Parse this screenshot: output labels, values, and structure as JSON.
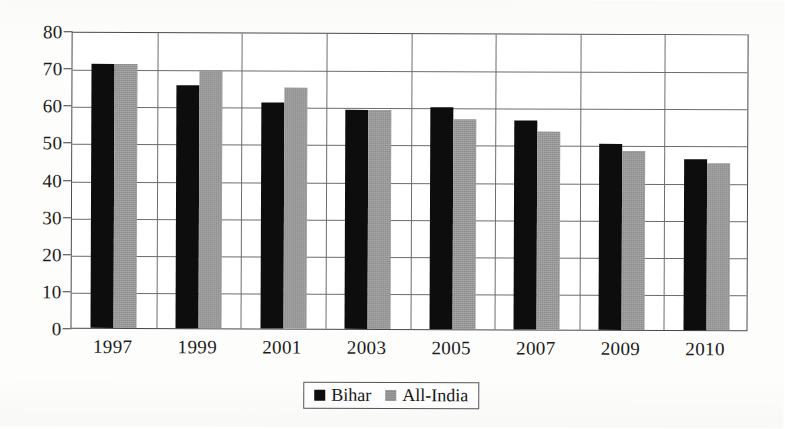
{
  "chart_data": {
    "type": "bar",
    "title": "",
    "subtitle": "",
    "xlabel": "",
    "ylabel": "",
    "categories": [
      "1997",
      "1999",
      "2001",
      "2003",
      "2005",
      "2007",
      "2009",
      "2010"
    ],
    "series": [
      {
        "name": "Bihar",
        "color": "#0d0d0d",
        "values": [
          71,
          65.5,
          61,
          59,
          59.7,
          56.3,
          50.2,
          46
        ]
      },
      {
        "name": "All-India",
        "color": "#8d8d8d",
        "values": [
          71,
          69.5,
          65,
          59,
          56.5,
          53.3,
          48.3,
          45
        ]
      }
    ],
    "ylim": [
      0,
      80
    ],
    "ytick_step": 10,
    "yticks": [
      "0",
      "10",
      "20",
      "30",
      "40",
      "50",
      "60",
      "70",
      "80"
    ],
    "grid": {
      "horizontal": true,
      "vertical": true
    },
    "legend": {
      "position": "bottom-center",
      "border": true
    }
  },
  "axes": {
    "y_tick_labels": [
      "80",
      "70",
      "60",
      "50",
      "40",
      "30",
      "20",
      "10",
      "0"
    ],
    "x_tick_labels": [
      "1997",
      "1999",
      "2001",
      "2003",
      "2005",
      "2007",
      "2009",
      "2010"
    ]
  },
  "legend": {
    "entries": [
      {
        "label": "Bihar",
        "swatch": "black-square-swatch"
      },
      {
        "label": "All-India",
        "swatch": "gray-square-swatch"
      }
    ]
  }
}
